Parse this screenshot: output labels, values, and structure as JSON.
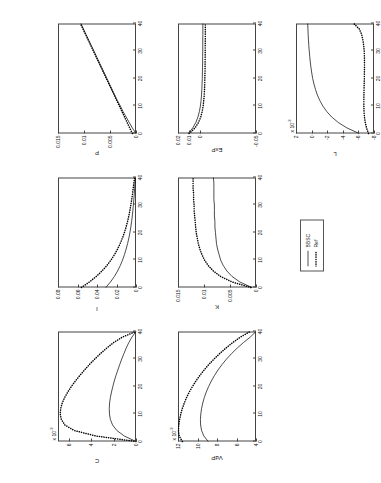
{
  "figure": {
    "legend": {
      "entries": [
        {
          "label": "BBSC",
          "style": "solid"
        },
        {
          "label": "Ref",
          "style": "dotted"
        }
      ]
    },
    "xaxis": {
      "ticks": [
        0,
        10,
        20,
        30,
        40
      ],
      "min": 0,
      "max": 40
    }
  },
  "chart_data": [
    {
      "type": "line",
      "title": "C",
      "xlabel": "",
      "ylabel": "C",
      "y_exponent": "x 10",
      "y_exponent_sup": "-3",
      "xlim": [
        0,
        40
      ],
      "ylim": [
        0,
        7
      ],
      "xticks": [
        0,
        10,
        20,
        30,
        40
      ],
      "yticks": [
        0,
        2,
        4,
        6
      ],
      "grid": false,
      "legend_position": "external",
      "series": [
        {
          "name": "BBSC",
          "style": "solid",
          "x": [
            0,
            2,
            4,
            6,
            8,
            10,
            12,
            14,
            16,
            18,
            20,
            22,
            24,
            26,
            28,
            30,
            32,
            34,
            36,
            38,
            40
          ],
          "y": [
            0.0,
            1.05,
            1.72,
            2.1,
            2.3,
            2.38,
            2.4,
            2.37,
            2.3,
            2.2,
            2.08,
            1.95,
            1.8,
            1.63,
            1.46,
            1.28,
            1.08,
            0.88,
            0.64,
            0.36,
            0.0
          ]
        },
        {
          "name": "Ref",
          "style": "dotted",
          "x": [
            0,
            2,
            4,
            6,
            8,
            10,
            12,
            14,
            16,
            18,
            20,
            22,
            24,
            26,
            28,
            30,
            32,
            34,
            36,
            38,
            40
          ],
          "y": [
            0.0,
            3.6,
            5.55,
            6.38,
            6.7,
            6.8,
            6.76,
            6.62,
            6.4,
            6.12,
            5.8,
            5.44,
            5.04,
            4.62,
            4.18,
            3.7,
            3.18,
            2.62,
            2.0,
            1.2,
            0.0
          ]
        }
      ]
    },
    {
      "type": "line",
      "title": "VdP",
      "xlabel": "",
      "ylabel": "VdP",
      "y_exponent": "x 10",
      "y_exponent_sup": "-3",
      "xlim": [
        0,
        40
      ],
      "ylim": [
        4,
        12
      ],
      "xticks": [
        0,
        10,
        20,
        30,
        40
      ],
      "yticks": [
        4,
        6,
        8,
        10,
        12
      ],
      "grid": false,
      "legend_position": "external",
      "series": [
        {
          "name": "BBSC",
          "style": "solid",
          "x": [
            0,
            2,
            4,
            6,
            8,
            10,
            12,
            14,
            16,
            18,
            20,
            22,
            24,
            26,
            28,
            30,
            32,
            34,
            36,
            38,
            40
          ],
          "y": [
            8.9,
            9.35,
            9.58,
            9.68,
            9.7,
            9.66,
            9.58,
            9.46,
            9.3,
            9.1,
            8.86,
            8.58,
            8.26,
            7.9,
            7.48,
            7.02,
            6.5,
            5.92,
            5.28,
            4.58,
            4.0
          ]
        },
        {
          "name": "Ref",
          "style": "dotted",
          "x": [
            0,
            2,
            4,
            6,
            8,
            10,
            12,
            14,
            16,
            18,
            20,
            22,
            24,
            26,
            28,
            30,
            32,
            34,
            36,
            38,
            40
          ],
          "y": [
            11.55,
            11.88,
            11.95,
            11.92,
            11.84,
            11.72,
            11.56,
            11.36,
            11.12,
            10.84,
            10.52,
            10.16,
            9.76,
            9.32,
            8.84,
            8.3,
            7.72,
            7.08,
            6.38,
            5.58,
            4.6
          ]
        }
      ]
    },
    {
      "type": "line",
      "title": "I",
      "xlabel": "",
      "ylabel": "I",
      "xlim": [
        0,
        40
      ],
      "ylim": [
        0,
        0.08
      ],
      "xticks": [
        0,
        10,
        20,
        30,
        40
      ],
      "yticks": [
        0,
        0.02,
        0.04,
        0.06,
        0.08
      ],
      "grid": false,
      "legend_position": "external",
      "series": [
        {
          "name": "BBSC",
          "style": "solid",
          "x": [
            0,
            2,
            4,
            6,
            8,
            10,
            12,
            14,
            16,
            18,
            20,
            22,
            24,
            26,
            28,
            30,
            32,
            34,
            36,
            38,
            40
          ],
          "y": [
            0.031,
            0.0262,
            0.0222,
            0.0189,
            0.0161,
            0.0138,
            0.0118,
            0.0101,
            0.0086,
            0.0073,
            0.0062,
            0.0053,
            0.0045,
            0.0038,
            0.0032,
            0.0027,
            0.0022,
            0.0018,
            0.0014,
            0.001,
            0.0006
          ]
        },
        {
          "name": "Ref",
          "style": "dotted",
          "x": [
            0,
            2,
            4,
            6,
            8,
            10,
            12,
            14,
            16,
            18,
            20,
            22,
            24,
            26,
            28,
            30,
            32,
            34,
            36,
            38,
            40
          ],
          "y": [
            0.056,
            0.0478,
            0.0408,
            0.0349,
            0.0299,
            0.0256,
            0.022,
            0.0189,
            0.0162,
            0.0139,
            0.0119,
            0.0102,
            0.0087,
            0.0074,
            0.0063,
            0.0053,
            0.0044,
            0.0036,
            0.0029,
            0.0022,
            0.0014
          ]
        }
      ]
    },
    {
      "type": "line",
      "title": "K",
      "xlabel": "",
      "ylabel": "K",
      "xlim": [
        0,
        40
      ],
      "ylim": [
        0,
        0.015
      ],
      "xticks": [
        0,
        10,
        20,
        30,
        40
      ],
      "yticks": [
        0,
        0.005,
        0.01,
        0.015
      ],
      "grid": false,
      "legend_position": "external",
      "series": [
        {
          "name": "BBSC",
          "style": "solid",
          "x": [
            0,
            2,
            4,
            6,
            8,
            10,
            12,
            14,
            16,
            18,
            20,
            22,
            24,
            26,
            28,
            30,
            32,
            34,
            36,
            38,
            40
          ],
          "y": [
            0.0008,
            0.0031,
            0.0046,
            0.0056,
            0.0063,
            0.0068,
            0.0071,
            0.0074,
            0.0076,
            0.0077,
            0.0078,
            0.0079,
            0.0079,
            0.008,
            0.008,
            0.008,
            0.0081,
            0.0081,
            0.0081,
            0.0081,
            0.0082
          ]
        },
        {
          "name": "Ref",
          "style": "dotted",
          "x": [
            0,
            2,
            4,
            6,
            8,
            10,
            12,
            14,
            16,
            18,
            20,
            22,
            24,
            26,
            28,
            30,
            32,
            34,
            36,
            38,
            40
          ],
          "y": [
            0.001,
            0.0046,
            0.0068,
            0.0082,
            0.0092,
            0.0099,
            0.0104,
            0.0108,
            0.0111,
            0.0113,
            0.0115,
            0.0116,
            0.0117,
            0.0118,
            0.0119,
            0.0119,
            0.012,
            0.012,
            0.0121,
            0.0121,
            0.0121
          ]
        }
      ]
    },
    {
      "type": "line",
      "title": "P",
      "xlabel": "",
      "ylabel": "P",
      "xlim": [
        0,
        40
      ],
      "ylim": [
        0,
        0.015
      ],
      "xticks": [
        0,
        10,
        20,
        30,
        40
      ],
      "yticks": [
        0,
        0.005,
        0.01,
        0.015
      ],
      "grid": false,
      "legend_position": "external",
      "series": [
        {
          "name": "BBSC",
          "style": "solid",
          "x": [
            0,
            2,
            4,
            6,
            8,
            10,
            12,
            14,
            16,
            18,
            20,
            22,
            24,
            26,
            28,
            30,
            32,
            34,
            36,
            38,
            40
          ],
          "y": [
            0.0,
            0.0007,
            0.0013,
            0.0019,
            0.0025,
            0.003,
            0.0036,
            0.0041,
            0.0046,
            0.0051,
            0.0056,
            0.0061,
            0.0066,
            0.0071,
            0.0076,
            0.0081,
            0.0086,
            0.0091,
            0.0096,
            0.0101,
            0.0106
          ]
        },
        {
          "name": "Ref",
          "style": "dotted",
          "x": [
            0,
            2,
            4,
            6,
            8,
            10,
            12,
            14,
            16,
            18,
            20,
            22,
            24,
            26,
            28,
            30,
            32,
            34,
            36,
            38,
            40
          ],
          "y": [
            0.0007,
            0.0012,
            0.0017,
            0.0022,
            0.0027,
            0.0032,
            0.0037,
            0.0042,
            0.0047,
            0.0052,
            0.0057,
            0.0062,
            0.0067,
            0.0072,
            0.0077,
            0.0082,
            0.0087,
            0.0092,
            0.0097,
            0.0102,
            0.0107
          ]
        }
      ]
    },
    {
      "type": "line",
      "title": "ExP",
      "xlabel": "",
      "ylabel": "ExP",
      "xlim": [
        0,
        40
      ],
      "ylim": [
        -0.05,
        0.02
      ],
      "xticks": [
        0,
        10,
        20,
        30,
        40
      ],
      "yticks": [
        -0.05,
        0,
        0.01,
        0.02
      ],
      "grid": false,
      "legend_position": "external",
      "series": [
        {
          "name": "BBSC",
          "style": "solid",
          "x": [
            0,
            2,
            4,
            6,
            8,
            10,
            12,
            14,
            16,
            18,
            20,
            22,
            24,
            26,
            28,
            30,
            32,
            34,
            36,
            38,
            40
          ],
          "y": [
            0.0108,
            0.0068,
            0.004,
            0.0021,
            0.0008,
            -0.0001,
            -0.0007,
            -0.0011,
            -0.0014,
            -0.0016,
            -0.0018,
            -0.0019,
            -0.002,
            -0.0021,
            -0.0021,
            -0.0022,
            -0.0022,
            -0.0022,
            -0.0023,
            -0.0023,
            -0.0023
          ]
        },
        {
          "name": "Ref",
          "style": "dotted",
          "x": [
            0,
            2,
            4,
            6,
            8,
            10,
            12,
            14,
            16,
            18,
            20,
            22,
            24,
            26,
            28,
            30,
            32,
            34,
            36,
            38,
            40
          ],
          "y": [
            0.01,
            0.0048,
            0.0016,
            -0.0004,
            -0.0017,
            -0.0026,
            -0.0031,
            -0.0035,
            -0.0038,
            -0.004,
            -0.0041,
            -0.0042,
            -0.0043,
            -0.0043,
            -0.0044,
            -0.0044,
            -0.0044,
            -0.0045,
            -0.0045,
            -0.0045,
            -0.0045
          ]
        }
      ]
    },
    {
      "type": "line",
      "title": "L",
      "xlabel": "",
      "ylabel": "L",
      "y_exponent": "x 10",
      "y_exponent_sup": "-3",
      "xlim": [
        0,
        40
      ],
      "ylim": [
        -8,
        2
      ],
      "xticks": [
        0,
        10,
        20,
        30,
        40
      ],
      "yticks": [
        2,
        0,
        -2,
        -4,
        -6,
        -8
      ],
      "grid": false,
      "legend_position": "external",
      "series": [
        {
          "name": "BBSC",
          "style": "solid",
          "x": [
            0,
            2,
            4,
            6,
            8,
            10,
            12,
            14,
            16,
            18,
            20,
            22,
            24,
            26,
            28,
            30,
            32,
            34,
            36,
            38,
            40
          ],
          "y": [
            -6.1,
            -4.55,
            -3.42,
            -2.58,
            -1.94,
            -1.44,
            -1.05,
            -0.74,
            -0.5,
            -0.3,
            -0.14,
            -0.02,
            0.08,
            0.17,
            0.24,
            0.3,
            0.36,
            0.4,
            0.44,
            0.47,
            0.5
          ]
        },
        {
          "name": "Ref",
          "style": "dotted",
          "x": [
            0,
            2,
            4,
            6,
            8,
            10,
            12,
            14,
            16,
            18,
            20,
            22,
            24,
            26,
            28,
            30,
            32,
            34,
            36,
            38,
            40
          ],
          "y": [
            -7.3,
            -7.05,
            -6.88,
            -6.78,
            -6.72,
            -6.7,
            -6.7,
            -6.71,
            -6.72,
            -6.74,
            -6.76,
            -6.77,
            -6.78,
            -6.78,
            -6.77,
            -6.74,
            -6.68,
            -6.58,
            -6.42,
            -6.12,
            -5.4
          ]
        }
      ]
    }
  ]
}
